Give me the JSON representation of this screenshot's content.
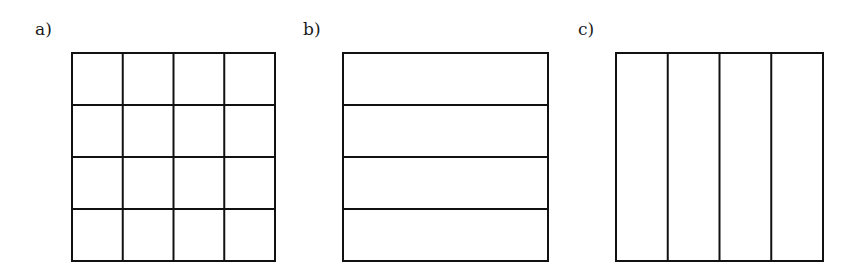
{
  "figure": {
    "stroke_color": "#111111",
    "stroke_width": 2,
    "panels": [
      {
        "id": "a",
        "label": "a)",
        "label_pos": {
          "x": 35,
          "y": 21
        },
        "box": {
          "x": 72,
          "y": 53,
          "width": 203,
          "height": 208
        },
        "rows": 4,
        "cols": 4,
        "description": "square divided into a 4x4 grid of cells"
      },
      {
        "id": "b",
        "label": "b)",
        "label_pos": {
          "x": 303,
          "y": 21
        },
        "box": {
          "x": 343,
          "y": 53,
          "width": 205,
          "height": 208
        },
        "rows": 4,
        "cols": 1,
        "description": "square divided into 4 horizontal strips"
      },
      {
        "id": "c",
        "label": "c)",
        "label_pos": {
          "x": 578,
          "y": 21
        },
        "box": {
          "x": 616,
          "y": 53,
          "width": 207,
          "height": 208
        },
        "rows": 1,
        "cols": 4,
        "description": "square divided into 4 vertical strips"
      }
    ]
  }
}
